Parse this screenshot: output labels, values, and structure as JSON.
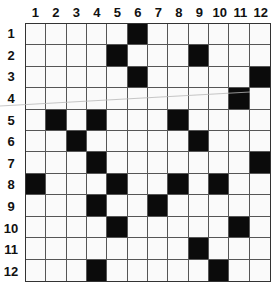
{
  "puzzle": {
    "type": "crossword-grid",
    "rows": 12,
    "cols": 12,
    "column_labels": [
      "1",
      "2",
      "3",
      "4",
      "5",
      "6",
      "7",
      "8",
      "9",
      "10",
      "11",
      "12"
    ],
    "row_labels": [
      "1",
      "2",
      "3",
      "4",
      "5",
      "6",
      "7",
      "8",
      "9",
      "10",
      "11",
      "12"
    ],
    "black_cells": {
      "1": [
        6
      ],
      "2": [
        5,
        9
      ],
      "3": [
        6,
        12
      ],
      "4": [
        11
      ],
      "5": [
        2,
        4,
        8
      ],
      "6": [
        3,
        9
      ],
      "7": [
        4,
        12
      ],
      "8": [
        1,
        5,
        8,
        10
      ],
      "9": [
        4,
        7
      ],
      "10": [
        5,
        11
      ],
      "11": [
        9
      ],
      "12": [
        4,
        10
      ]
    },
    "colors": {
      "black_cell": "#0b0b0b",
      "white_cell": "#fafafa",
      "grid_line": "#555555"
    }
  }
}
